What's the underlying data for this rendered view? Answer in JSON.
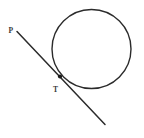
{
  "figure": {
    "kind": "geometry-diagram",
    "background_color": "#ffffff",
    "stroke_color": "#2b2b2b",
    "label_color": "#3a3a3a",
    "point_color": "#1a1a1a",
    "width": 144,
    "height": 138,
    "circle": {
      "name": "circle",
      "cx": 91.5,
      "cy": 49.0,
      "r": 39.5,
      "stroke_width": 1.4
    },
    "tangent_line": {
      "name": "tangent-line",
      "x1": 17.0,
      "y1": 31.5,
      "x2": 105.0,
      "y2": 124.5,
      "stroke_width": 1.5
    },
    "points": [
      {
        "id": "T",
        "label": "T",
        "cx": 60.0,
        "cy": 76.5,
        "r": 2.1,
        "label_x": 53.0,
        "label_y": 90.0
      }
    ],
    "labels": [
      {
        "id": "P",
        "label": "P",
        "x": 8.5,
        "y": 31.0
      }
    ]
  }
}
